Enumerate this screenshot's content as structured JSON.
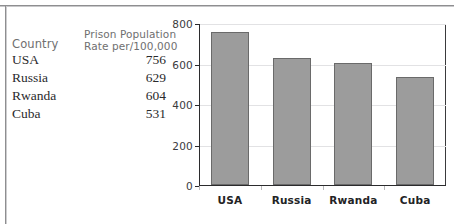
{
  "table": {
    "headers": {
      "country": "Country",
      "rate_line1": "Prison Population",
      "rate_line2": "Rate per/100,000"
    },
    "rows": [
      {
        "country": "USA",
        "value": "756"
      },
      {
        "country": "Russia",
        "value": "629"
      },
      {
        "country": "Rwanda",
        "value": "604"
      },
      {
        "country": "Cuba",
        "value": "531"
      }
    ]
  },
  "chart_data": {
    "type": "bar",
    "title": "",
    "xlabel": "",
    "ylabel": "",
    "categories": [
      "USA",
      "Russia",
      "Rwanda",
      "Cuba"
    ],
    "values": [
      756,
      629,
      604,
      531
    ],
    "ylim": [
      0,
      800
    ],
    "yticks": [
      0,
      200,
      400,
      600,
      800
    ],
    "ytick_labels": [
      "0",
      "200",
      "400",
      "600",
      "800"
    ],
    "grid": true,
    "legend": false,
    "bar_color": "#9c9c9c",
    "bar_edge_color": "#6a6a6a"
  }
}
